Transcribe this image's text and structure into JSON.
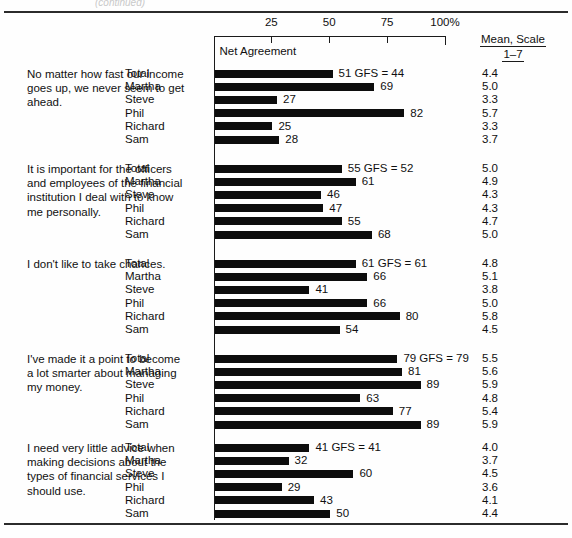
{
  "figure": {
    "ghost_text": "(continued)",
    "plot_label": "Net Agreement",
    "axis_unit_suffix": "%",
    "mean_header_line1": "Mean, Scale",
    "mean_header_line2": "1–7"
  },
  "chart_data": {
    "type": "bar",
    "title": "Net Agreement",
    "xlabel": "",
    "ylabel": "",
    "xlim": [
      0,
      100
    ],
    "xticks": [
      0,
      25,
      50,
      75,
      100
    ],
    "xtick_labels": [
      "",
      "25",
      "50",
      "75",
      "100%"
    ],
    "grid": false,
    "legend": "none",
    "orientation": "horizontal",
    "value_columns": [
      "Net Agreement",
      "Mean, Scale 1–7"
    ],
    "categories": [
      "Total",
      "Martha",
      "Steve",
      "Phil",
      "Richard",
      "Sam"
    ],
    "groups": [
      {
        "statement": "No matter how fast our income goes up, we never seem to get ahead.",
        "gfs_label": "GFS = 44",
        "gfs_value": 44,
        "rows": [
          {
            "name": "Total",
            "value": 51,
            "value_label": "51 GFS = 44",
            "mean": "4.4"
          },
          {
            "name": "Martha",
            "value": 69,
            "value_label": "69",
            "mean": "5.0"
          },
          {
            "name": "Steve",
            "value": 27,
            "value_label": "27",
            "mean": "3.3"
          },
          {
            "name": "Phil",
            "value": 82,
            "value_label": "82",
            "mean": "5.7"
          },
          {
            "name": "Richard",
            "value": 25,
            "value_label": "25",
            "mean": "3.3"
          },
          {
            "name": "Sam",
            "value": 28,
            "value_label": "28",
            "mean": "3.7"
          }
        ]
      },
      {
        "statement": "It is important for the officers and employees of the financial institution I deal with to know me personally.",
        "gfs_label": "GFS = 52",
        "gfs_value": 52,
        "rows": [
          {
            "name": "Total",
            "value": 55,
            "value_label": "55 GFS = 52",
            "mean": "5.0"
          },
          {
            "name": "Martha",
            "value": 61,
            "value_label": "61",
            "mean": "4.9"
          },
          {
            "name": "Steve",
            "value": 46,
            "value_label": "46",
            "mean": "4.3"
          },
          {
            "name": "Phil",
            "value": 47,
            "value_label": "47",
            "mean": "4.3"
          },
          {
            "name": "Richard",
            "value": 55,
            "value_label": "55",
            "mean": "4.7"
          },
          {
            "name": "Sam",
            "value": 68,
            "value_label": "68",
            "mean": "5.0"
          }
        ]
      },
      {
        "statement": "I don't like to take chances.",
        "gfs_label": "GFS = 61",
        "gfs_value": 61,
        "rows": [
          {
            "name": "Total",
            "value": 61,
            "value_label": "61 GFS = 61",
            "mean": "4.8"
          },
          {
            "name": "Martha",
            "value": 66,
            "value_label": "66",
            "mean": "5.1"
          },
          {
            "name": "Steve",
            "value": 41,
            "value_label": "41",
            "mean": "3.8"
          },
          {
            "name": "Phil",
            "value": 66,
            "value_label": "66",
            "mean": "5.0"
          },
          {
            "name": "Richard",
            "value": 80,
            "value_label": "80",
            "mean": "5.8"
          },
          {
            "name": "Sam",
            "value": 54,
            "value_label": "54",
            "mean": "4.5"
          }
        ]
      },
      {
        "statement": "I've made it a point to become a lot smarter about managing my money.",
        "gfs_label": "GFS = 79",
        "gfs_value": 79,
        "rows": [
          {
            "name": "Total",
            "value": 79,
            "value_label": "79 GFS = 79",
            "mean": "5.5"
          },
          {
            "name": "Martha",
            "value": 81,
            "value_label": "81",
            "mean": "5.6"
          },
          {
            "name": "Steve",
            "value": 89,
            "value_label": "89",
            "mean": "5.9"
          },
          {
            "name": "Phil",
            "value": 63,
            "value_label": "63",
            "mean": "4.8"
          },
          {
            "name": "Richard",
            "value": 77,
            "value_label": "77",
            "mean": "5.4"
          },
          {
            "name": "Sam",
            "value": 89,
            "value_label": "89",
            "mean": "5.9"
          }
        ]
      },
      {
        "statement": "I need very little advice when making decisions about the types of financial services I should use.",
        "gfs_label": "GFS = 41",
        "gfs_value": 41,
        "rows": [
          {
            "name": "Total",
            "value": 41,
            "value_label": "41 GFS = 41",
            "mean": "4.0"
          },
          {
            "name": "Martha",
            "value": 32,
            "value_label": "32",
            "mean": "3.7"
          },
          {
            "name": "Steve",
            "value": 60,
            "value_label": "60",
            "mean": "4.5"
          },
          {
            "name": "Phil",
            "value": 29,
            "value_label": "29",
            "mean": "3.6"
          },
          {
            "name": "Richard",
            "value": 43,
            "value_label": "43",
            "mean": "4.1"
          },
          {
            "name": "Sam",
            "value": 50,
            "value_label": "50",
            "mean": "4.4"
          }
        ]
      }
    ]
  }
}
